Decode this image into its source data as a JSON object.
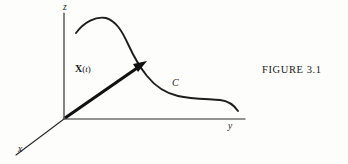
{
  "figure": {
    "caption": "FIGURE 3.1",
    "background_color": "#fdfdfc",
    "ink_color": "#1d1d1d"
  },
  "axes": {
    "z_label": "z",
    "y_label": "y",
    "x_label": "x",
    "origin": {
      "x": 64,
      "y": 119
    }
  },
  "curve": {
    "label": "C",
    "description": "space curve descending from a crest to a plateau"
  },
  "vector": {
    "bold_symbol": "X",
    "open_paren": "(",
    "parameter": "t",
    "close_paren": ")",
    "tip": {
      "x": 146,
      "y": 62
    }
  }
}
